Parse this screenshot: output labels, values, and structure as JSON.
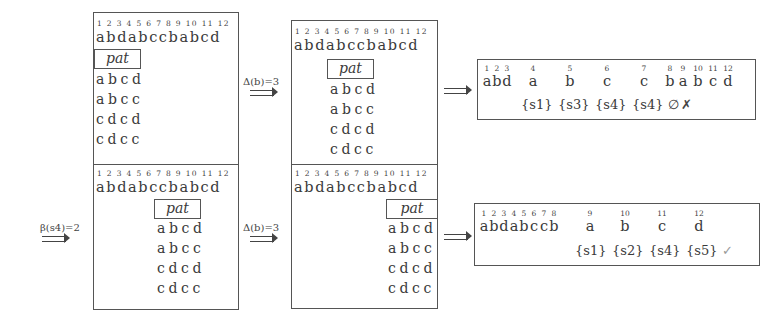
{
  "text": "abdabccbabcd",
  "indices": "1 2 3 4 5 6 7 8 9 10 11 12",
  "pattern_label": "pat",
  "patterns": [
    "abcd",
    "abcc",
    "cdcd",
    "cdcc"
  ],
  "arrows": {
    "delta_top": "Δ(b)=3",
    "delta_bottom": "Δ(b)=3",
    "beta": "β(s4)=2",
    "implies_top": "⟹",
    "implies_bottom": "⟹"
  },
  "panels": [
    {
      "id": "top-left",
      "pattern_offset": 0
    },
    {
      "id": "top-middle",
      "pattern_offset": 3
    },
    {
      "id": "bottom-left",
      "pattern_offset": 5
    },
    {
      "id": "bottom-middle",
      "pattern_offset": 8
    }
  ],
  "results": {
    "top": {
      "cells": [
        {
          "n": "1",
          "c": "a"
        },
        {
          "n": "2",
          "c": "b"
        },
        {
          "n": "3",
          "c": "d"
        },
        {
          "n": "4",
          "c": "a"
        },
        {
          "n": "5",
          "c": "b"
        },
        {
          "n": "6",
          "c": "c"
        },
        {
          "n": "7",
          "c": "c"
        },
        {
          "n": "8",
          "c": "b"
        },
        {
          "n": "9",
          "c": "a"
        },
        {
          "n": "10",
          "c": "b"
        },
        {
          "n": "11",
          "c": "c"
        },
        {
          "n": "12",
          "c": "d"
        }
      ],
      "sets": [
        "{s1}",
        "{s3}",
        "{s4}",
        "{s4}"
      ],
      "empty_set": "∅",
      "status": "✗",
      "status_color": "#444444"
    },
    "bottom": {
      "cells": [
        {
          "n": "1",
          "c": "a"
        },
        {
          "n": "2",
          "c": "b"
        },
        {
          "n": "3",
          "c": "d"
        },
        {
          "n": "4",
          "c": "a"
        },
        {
          "n": "5",
          "c": "b"
        },
        {
          "n": "6",
          "c": "c"
        },
        {
          "n": "7",
          "c": "c"
        },
        {
          "n": "8",
          "c": "b"
        },
        {
          "n": "9",
          "c": "a"
        },
        {
          "n": "10",
          "c": "b"
        },
        {
          "n": "11",
          "c": "c"
        },
        {
          "n": "12",
          "c": "d"
        }
      ],
      "sets": [
        "{s1}",
        "{s2}",
        "{s4}",
        "{s5}"
      ],
      "status": "✓",
      "status_color": "#999999"
    }
  }
}
